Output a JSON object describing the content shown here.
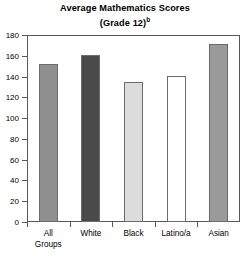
{
  "chart_data": {
    "type": "bar",
    "title": "Average Mathematics Scores",
    "subtitle": "(Grade 12)",
    "subtitle_superscript": "b",
    "categories": [
      "All Groups",
      "White",
      "Black",
      "Latino/a",
      "Asian"
    ],
    "category_lines": [
      [
        "All",
        "Groups"
      ],
      [
        "White"
      ],
      [
        "Black"
      ],
      [
        "Latino/a"
      ],
      [
        "Asian"
      ]
    ],
    "values": [
      152,
      161,
      135,
      141,
      171
    ],
    "xlabel": "",
    "ylabel": "",
    "ylim": [
      0,
      180
    ],
    "ytick_labels": [
      "0",
      "20",
      "40",
      "60",
      "80",
      "100",
      "120",
      "140",
      "160",
      "180"
    ],
    "ytick_values": [
      0,
      20,
      40,
      60,
      80,
      100,
      120,
      140,
      160,
      180
    ],
    "grid": false,
    "legend": "none",
    "bar_colors": [
      "#8f8f8f",
      "#4a4a4a",
      "#dcdcdc",
      "#ffffff",
      "#9a9a9a"
    ],
    "bar_edge_color": "#6b6b6b",
    "frame_color": "#5a5a5a",
    "background": "#ffffff"
  }
}
